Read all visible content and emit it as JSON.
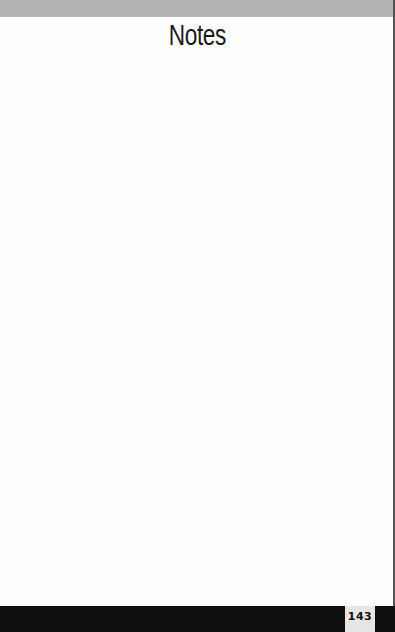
{
  "page": {
    "title": "Notes",
    "page_number": "143",
    "notes_body": ""
  },
  "colors": {
    "top_band": "#b4b4b4",
    "footer_bar": "#0f0f0f",
    "page_number_box": "#e6e6e6",
    "background": "#fdfdfd"
  }
}
